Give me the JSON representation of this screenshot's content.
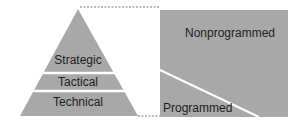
{
  "diagram": {
    "pyramid": {
      "levels": [
        {
          "label": "Strategic"
        },
        {
          "label": "Tactical"
        },
        {
          "label": "Technical"
        }
      ]
    },
    "decision_box": {
      "upper_label": "Nonprogrammed",
      "lower_label": "Programmed"
    },
    "colors": {
      "fill": "#a8a8a8",
      "divider": "#ffffff",
      "dashed_line": "#555555",
      "text": "#1e1e1e"
    }
  }
}
